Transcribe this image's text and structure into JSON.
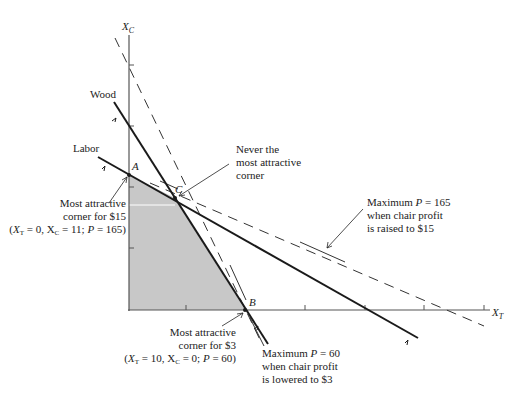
{
  "axes": {
    "x_label": "X",
    "x_sub": "T",
    "y_label": "X",
    "y_sub": "C"
  },
  "constraints": {
    "wood": "Wood",
    "labor": "Labor"
  },
  "corners": {
    "a": "A",
    "b": "B",
    "c": "C"
  },
  "annotations": {
    "never": [
      "Never the",
      "most attractive",
      "corner"
    ],
    "max165": [
      "Maximum P = 165",
      "when chair profit",
      "is raised to $15"
    ],
    "max60": [
      "Maximum P = 60",
      "when chair profit",
      "is lowered to $3"
    ],
    "corner15": [
      "Most attractive",
      "corner for $15",
      "(X_T = 0, X_C = 11; P = 165)"
    ],
    "corner3": [
      "Most attractive",
      "corner for $3",
      "(X_T = 10, X_C = 0; P = 60)"
    ]
  },
  "colors": {
    "feasible_region": "#c8c8c8",
    "lines": "#1a1a1a",
    "axis": "#555555"
  }
}
